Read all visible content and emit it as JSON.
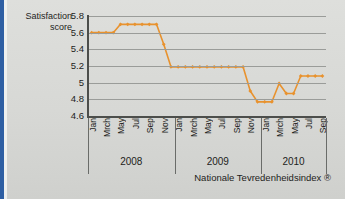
{
  "theme": {
    "series_color": "#e8922e",
    "grid_color": "#9a9c99",
    "axis_color": "#4c4e4b",
    "text_color": "#1d1d1b",
    "page_background": "#d9d9d6",
    "accent_stripe": "#2e5fa3"
  },
  "axis_title": {
    "line1": "Satisfaction",
    "line2": "score"
  },
  "footer": {
    "text": "Nationale Tevredenheidsindex ®"
  },
  "years": [
    {
      "label": "2008"
    },
    {
      "label": "2009"
    },
    {
      "label": "2010"
    }
  ],
  "chart_data": {
    "type": "line",
    "title": "",
    "subtitle": "",
    "xlabel": "",
    "ylabel": "Satisfaction score",
    "ylim": [
      4.6,
      5.8
    ],
    "yticks": [
      "4.6",
      "4.8",
      "5",
      "5.2",
      "5.4",
      "5.6",
      "5.8"
    ],
    "ytick_values": [
      4.6,
      4.8,
      5.0,
      5.2,
      5.4,
      5.6,
      5.8
    ],
    "grid": true,
    "legend": "none",
    "marker": "diamond",
    "annotation": "Nationale Tevredenheidsindex ®",
    "xtick_labels": [
      "Jan",
      "Mrch",
      "May",
      "Jul",
      "Sep",
      "Nov",
      "Jan",
      "Mrch",
      "May",
      "Jul",
      "Sep",
      "Nov",
      "Jan",
      "Mrch",
      "May",
      "Jul",
      "Sep"
    ],
    "x": [
      "Jan 2008",
      "Feb 2008",
      "Mrch 2008",
      "Apr 2008",
      "May 2008",
      "Jun 2008",
      "Jul 2008",
      "Aug 2008",
      "Sep 2008",
      "Oct 2008",
      "Nov 2008",
      "Dec 2008",
      "Jan 2009",
      "Feb 2009",
      "Mrch 2009",
      "Apr 2009",
      "May 2009",
      "Jun 2009",
      "Jul 2009",
      "Aug 2009",
      "Sep 2009",
      "Oct 2009",
      "Nov 2009",
      "Dec 2009",
      "Jan 2010",
      "Feb 2010",
      "Mrch 2010",
      "Apr 2010",
      "May 2010",
      "Jun 2010",
      "Jul 2010",
      "Aug 2010",
      "Sep 2010"
    ],
    "values": [
      5.6,
      5.6,
      5.6,
      5.6,
      5.7,
      5.7,
      5.7,
      5.7,
      5.7,
      5.7,
      5.46,
      5.19,
      5.19,
      5.19,
      5.19,
      5.19,
      5.19,
      5.19,
      5.19,
      5.19,
      5.19,
      5.19,
      4.9,
      4.77,
      4.77,
      4.77,
      4.99,
      4.87,
      4.87,
      5.08,
      5.08,
      5.08,
      5.08
    ],
    "series": [
      {
        "name": "Satisfaction score",
        "color": "#e8922e",
        "values": [
          5.6,
          5.6,
          5.6,
          5.6,
          5.7,
          5.7,
          5.7,
          5.7,
          5.7,
          5.7,
          5.46,
          5.19,
          5.19,
          5.19,
          5.19,
          5.19,
          5.19,
          5.19,
          5.19,
          5.19,
          5.19,
          5.19,
          4.9,
          4.77,
          4.77,
          4.77,
          4.99,
          4.87,
          4.87,
          5.08,
          5.08,
          5.08,
          5.08
        ]
      }
    ]
  }
}
